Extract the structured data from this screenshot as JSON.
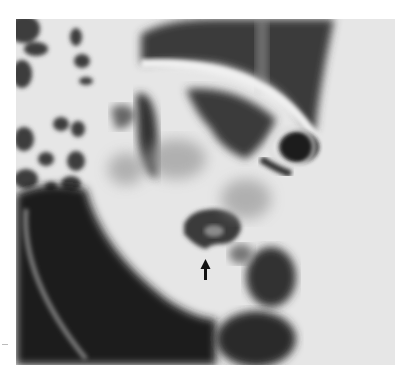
{
  "figure": {
    "type": "radiograph",
    "tone": "grayscale",
    "annotations": [
      {
        "kind": "arrow",
        "direction": "up",
        "x": 205,
        "y": 268,
        "color": "#111111"
      }
    ]
  },
  "colors": {
    "background": "#ffffff",
    "film_light": "#e6e6e6",
    "film_dark": "#1c1c1c",
    "mid": "#7a7a7a"
  }
}
